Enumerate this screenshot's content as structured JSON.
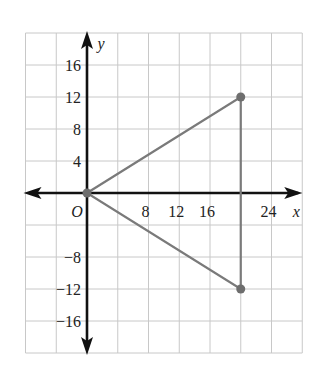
{
  "chart_data": {
    "type": "scatter",
    "title": "",
    "xlabel": "x",
    "ylabel": "y",
    "origin_label": "O",
    "xlim": [
      -8,
      28
    ],
    "ylim": [
      -20,
      20
    ],
    "grid": true,
    "grid_step": 4,
    "x_tick_labels": [
      "8",
      "12",
      "16",
      "24"
    ],
    "x_tick_values": [
      8,
      12,
      16,
      24
    ],
    "y_tick_labels": [
      "16",
      "12",
      "8",
      "4",
      "−8",
      "−12",
      "−16"
    ],
    "y_tick_values": [
      16,
      12,
      8,
      4,
      -8,
      -12,
      -16
    ],
    "series": [
      {
        "name": "triangle",
        "closed": true,
        "points": [
          {
            "x": 0,
            "y": 0
          },
          {
            "x": 20,
            "y": 12
          },
          {
            "x": 20,
            "y": -12
          }
        ]
      }
    ],
    "colors": {
      "grid": "#c8c8c8",
      "axis": "#111111",
      "shape": "#7a7a7a",
      "point": "#6e6e6e"
    }
  }
}
